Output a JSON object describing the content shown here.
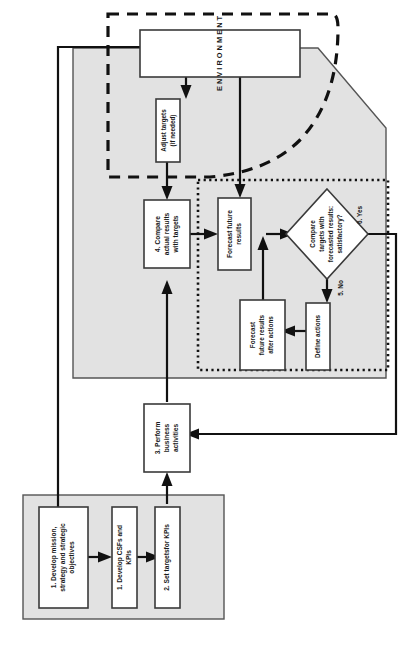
{
  "diagram": {
    "title_letters": "ENVIRONMENT",
    "nodes": {
      "environment": {
        "label": "E N V I R O N M E N T"
      },
      "adjust_targets": {
        "line1": "Adjust targets",
        "line2": "(if needed)"
      },
      "compare_actual": {
        "line1": "4. Compare",
        "line2": "actual results",
        "line3": "with targets"
      },
      "forecast_future": {
        "line1": "Forecast future",
        "line2": "results"
      },
      "decision": {
        "line1": "Compare",
        "line2": "targets with",
        "line3": "forecasted results:",
        "line4": "satisfactory?"
      },
      "define_actions": {
        "line1": "Define actions"
      },
      "forecast_after": {
        "line1": "Forecast",
        "line2": "future results",
        "line3": "after actions"
      },
      "perform_business": {
        "line1": "3. Perform",
        "line2": "business",
        "line3": "activities"
      },
      "develop_mission": {
        "line1": "1. Develop mission,",
        "line2": "strategy and strategic",
        "line3": "objectives"
      },
      "develop_csfs": {
        "line1": "1. Develop CSFs and",
        "line2": "KPIs"
      },
      "set_targets": {
        "line1": "2. Set targetsfor KPIs"
      }
    },
    "edge_labels": {
      "yes": "6. Yes",
      "no": "5. No"
    },
    "colors": {
      "gray_fill": "#e2e2e2",
      "line": "#111111",
      "box_stroke": "#3a3a3a",
      "background": "#ffffff"
    }
  }
}
